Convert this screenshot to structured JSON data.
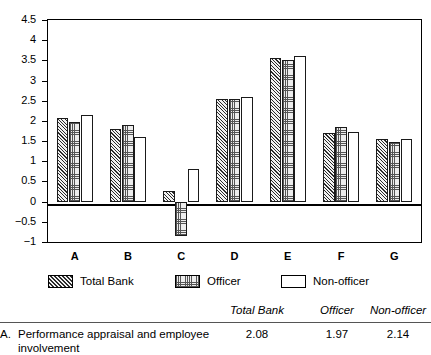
{
  "chart_data": {
    "type": "bar",
    "title": "",
    "xlabel": "",
    "ylabel": "",
    "grid": false,
    "legend_position": "bottom",
    "ylim": [
      -1,
      4.5
    ],
    "yticks": [
      -1,
      -0.5,
      0,
      0.5,
      1,
      1.5,
      2,
      2.5,
      3,
      3.5,
      4,
      4.5
    ],
    "ytick_labels": [
      "−1",
      "−0.5",
      "0",
      "0.5",
      "1",
      "1.5",
      "2",
      "2.5",
      "3",
      "3.5",
      "4",
      "4.5"
    ],
    "categories": [
      "A",
      "B",
      "C",
      "D",
      "E",
      "F",
      "G"
    ],
    "series": [
      {
        "name": "Total Bank",
        "pattern": "diagonal-hatch",
        "values": [
          2.08,
          1.8,
          0.27,
          2.55,
          3.55,
          1.7,
          1.55
        ]
      },
      {
        "name": "Officer",
        "pattern": "stipple-dots",
        "values": [
          1.97,
          1.9,
          -0.85,
          2.55,
          3.5,
          1.85,
          1.48
        ]
      },
      {
        "name": "Non-officer",
        "pattern": "empty-white",
        "values": [
          2.14,
          1.6,
          0.8,
          2.6,
          3.62,
          1.72,
          1.55
        ]
      }
    ]
  },
  "legend": {
    "items": [
      {
        "label": "Total Bank",
        "swatch": "diagonal-hatch-swatch"
      },
      {
        "label": "Officer",
        "swatch": "stipple-dots-swatch"
      },
      {
        "label": "Non-officer",
        "swatch": "empty-white-swatch"
      }
    ]
  },
  "table": {
    "headers": [
      "Total Bank",
      "Officer",
      "Non-officer"
    ],
    "rows": [
      {
        "letter": "A.",
        "label": "Performance appraisal and employee involvement",
        "values": [
          "2.08",
          "1.97",
          "2.14"
        ]
      }
    ]
  },
  "colors": {
    "axis": "#000000",
    "bar_outline": "#1a1a1a",
    "hatch": "#2b2b2b",
    "stipple": "#555555",
    "background": "#ffffff",
    "rule": "#555555"
  }
}
